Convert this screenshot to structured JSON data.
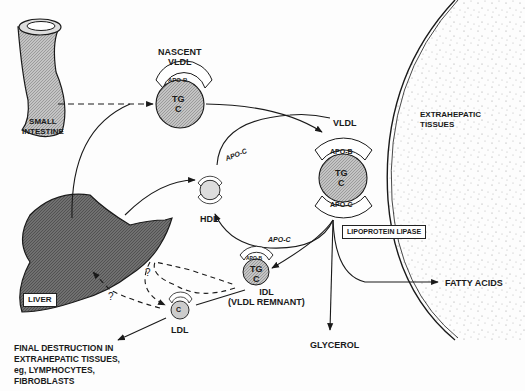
{
  "labels": {
    "small_intestine": [
      "SMALL",
      "INTESTINE"
    ],
    "nascent_vldl": [
      "NASCENT",
      "VLDL"
    ],
    "vldl": "VLDL",
    "extrahepatic_tissues": [
      "EXTRAHEPATIC",
      "TISSUES"
    ],
    "hdl": "HDL",
    "liver": "LIVER",
    "lipoprotein_lipase": "LIPOPROTEIN LIPASE",
    "idl": [
      "IDL",
      "(VLDL REMNANT)"
    ],
    "ldl": "LDL",
    "fatty_acids": "FATTY ACIDS",
    "glycerol": "GLYCEROL",
    "final_destruction": [
      "FINAL DESTRUCTION IN",
      "EXTRAHEPATIC TISSUES,",
      "eg, LYMPHOCYTES,",
      "FIBROBLASTS"
    ],
    "apo_c_top": "APO-C",
    "apo_c_bottom": "APO-C",
    "question_1": "?",
    "question_2": "?"
  },
  "particles": {
    "nascent_vldl": {
      "cap": "APO-B",
      "core": [
        "TG",
        "C"
      ]
    },
    "vldl": {
      "cap_top": "APO-B",
      "cap_bottom": "APO-C",
      "core": [
        "TG",
        "C"
      ]
    },
    "idl": {
      "cap": "APO-B",
      "core": [
        "TG",
        "C"
      ]
    },
    "ldl": {
      "cap": "APO-B",
      "core": [
        "C"
      ]
    },
    "hdl": {
      "cap_top": "APO-C",
      "cap_bottom": "APO-B"
    }
  },
  "colors": {
    "ink": "#1a1a1a",
    "particle_fill": "#c8c8c8",
    "liver_fill": "#6e6e6e",
    "intestine_fill": "#bdbdbd",
    "stipple": "#9a9a9a"
  }
}
